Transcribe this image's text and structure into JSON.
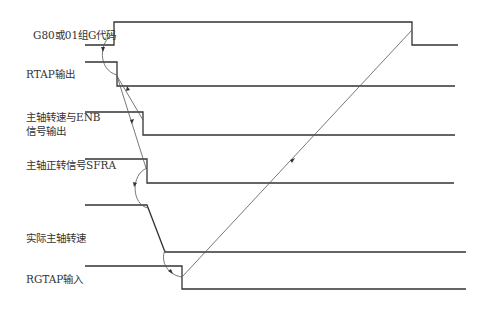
{
  "diagram": {
    "type": "timing-diagram",
    "signals": [
      {
        "id": "g80",
        "label": "G80或01组G代码"
      },
      {
        "id": "rtap",
        "label": "RTAP输出"
      },
      {
        "id": "enb",
        "label_line1": "主轴转速与ENB",
        "label_line2": "信号输出"
      },
      {
        "id": "sfra",
        "label": "主轴正转信号SFRA"
      },
      {
        "id": "speed",
        "label": "实际主轴转速"
      },
      {
        "id": "rgtap",
        "label": "RGTAP输入"
      }
    ],
    "colors": {
      "line": "#333333",
      "arrow": "#555555",
      "text": "#333333"
    }
  }
}
